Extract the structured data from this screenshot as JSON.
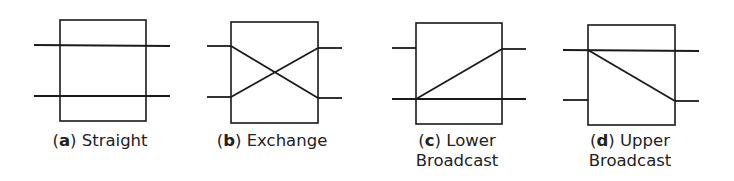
{
  "stroke_color": "#1a1a1a",
  "panels": [
    {
      "id": "a",
      "letter": "a",
      "label_line1": "Straight",
      "label_line2": "",
      "setting": "straight",
      "box": {
        "x": 60,
        "y": 20,
        "w": 86,
        "h": 101
      },
      "lines": [
        {
          "x1": 34,
          "y1": 45,
          "x2": 170,
          "y2": 46
        },
        {
          "x1": 34,
          "y1": 96,
          "x2": 170,
          "y2": 96
        }
      ],
      "caption_x": 100,
      "caption_y": 131
    },
    {
      "id": "b",
      "letter": "b",
      "label_line1": "Exchange",
      "label_line2": "",
      "setting": "exchange",
      "box": {
        "x": 231,
        "y": 22,
        "w": 87,
        "h": 101
      },
      "lines": [
        {
          "x1": 207,
          "y1": 46,
          "x2": 231,
          "y2": 46
        },
        {
          "x1": 207,
          "y1": 97,
          "x2": 231,
          "y2": 97
        },
        {
          "x1": 318,
          "y1": 48,
          "x2": 342,
          "y2": 48
        },
        {
          "x1": 318,
          "y1": 98,
          "x2": 342,
          "y2": 98
        },
        {
          "x1": 231,
          "y1": 46,
          "x2": 318,
          "y2": 98
        },
        {
          "x1": 231,
          "y1": 97,
          "x2": 318,
          "y2": 48
        }
      ],
      "caption_x": 272,
      "caption_y": 131
    },
    {
      "id": "c",
      "letter": "c",
      "label_line1": "Lower",
      "label_line2": "Broadcast",
      "setting": "lower-broadcast",
      "box": {
        "x": 416,
        "y": 23,
        "w": 86,
        "h": 101
      },
      "lines": [
        {
          "x1": 392,
          "y1": 48,
          "x2": 416,
          "y2": 48
        },
        {
          "x1": 502,
          "y1": 49,
          "x2": 526,
          "y2": 49
        },
        {
          "x1": 392,
          "y1": 99,
          "x2": 526,
          "y2": 99
        },
        {
          "x1": 416,
          "y1": 99,
          "x2": 502,
          "y2": 49
        }
      ],
      "caption_x": 457,
      "caption_y": 131
    },
    {
      "id": "d",
      "letter": "d",
      "label_line1": "Upper",
      "label_line2": "Broadcast",
      "setting": "upper-broadcast",
      "box": {
        "x": 588,
        "y": 25,
        "w": 87,
        "h": 100
      },
      "lines": [
        {
          "x1": 563,
          "y1": 50,
          "x2": 699,
          "y2": 51
        },
        {
          "x1": 563,
          "y1": 100,
          "x2": 588,
          "y2": 100
        },
        {
          "x1": 675,
          "y1": 101,
          "x2": 699,
          "y2": 101
        },
        {
          "x1": 588,
          "y1": 50,
          "x2": 675,
          "y2": 101
        }
      ],
      "caption_x": 630,
      "caption_y": 131
    }
  ]
}
